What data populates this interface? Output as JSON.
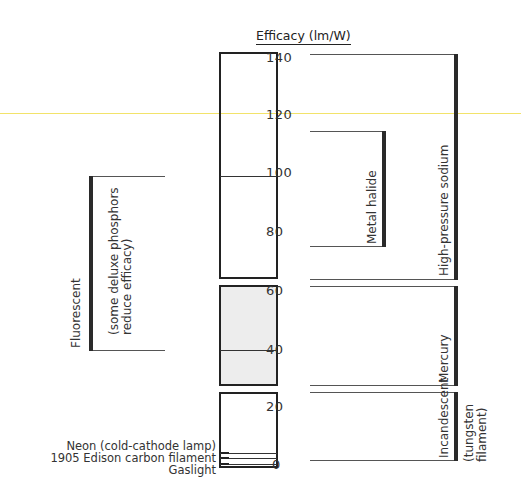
{
  "title": "Efficacy (lm/W)",
  "axis": {
    "ticks": [
      "140",
      "120",
      "100",
      "80",
      "60",
      "40",
      "20",
      "0"
    ],
    "tick_values": [
      140,
      120,
      100,
      80,
      60,
      40,
      20,
      0
    ]
  },
  "sources_left": [
    {
      "label": "Neon (cold-cathode lamp)",
      "value": 5
    },
    {
      "label": "1905 Edison carbon filament",
      "value": 4
    },
    {
      "label": "Gaslight",
      "value": 1
    }
  ],
  "ranges": {
    "fluorescent": {
      "label": "Fluorescent",
      "note_line1": "(some deluxe phosphors",
      "note_line2": "reduce efficacy)",
      "min": 38,
      "max": 98
    },
    "metal_halide": {
      "label": "Metal halide",
      "min": 75,
      "max": 114
    },
    "high_pressure_sodium": {
      "label": "High-pressure sodium",
      "min": 63,
      "max": 140
    },
    "mercury": {
      "label": "Mercury",
      "min": 26,
      "max": 60
    },
    "incandescent": {
      "label": "Incandescent",
      "note_line1": "(tungsten",
      "note_line2": "filament)",
      "min": 1,
      "max": 24
    }
  },
  "colors": {
    "line": "#555555",
    "range_bar": "#2a2a2a",
    "gray_band": "#ededed",
    "highlight_line": "#f2e36a"
  }
}
